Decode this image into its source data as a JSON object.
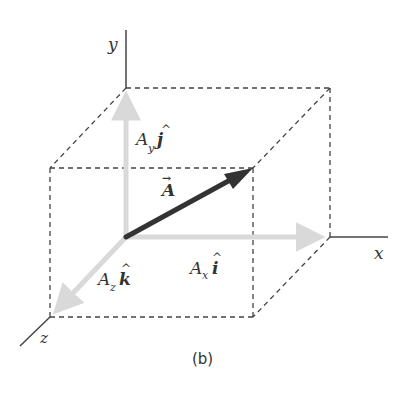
{
  "figure": {
    "caption": "(b)",
    "axes": {
      "x_label": "x",
      "y_label": "y",
      "z_label": "z"
    },
    "vector": {
      "name": "A",
      "arrow_glyph": "→"
    },
    "components": {
      "x": {
        "coef": "A",
        "sub": "x",
        "unit": "i",
        "hat": "^"
      },
      "y": {
        "coef": "A",
        "sub": "y",
        "unit": "j",
        "hat": "^"
      },
      "z": {
        "coef": "A",
        "sub": "z",
        "unit": "k",
        "hat": "^"
      }
    },
    "colors": {
      "axis": "#444444",
      "dashed_box": "#444444",
      "component_arrows": "#d9d9d9",
      "main_vector": "#333333",
      "text": "#333333"
    }
  }
}
